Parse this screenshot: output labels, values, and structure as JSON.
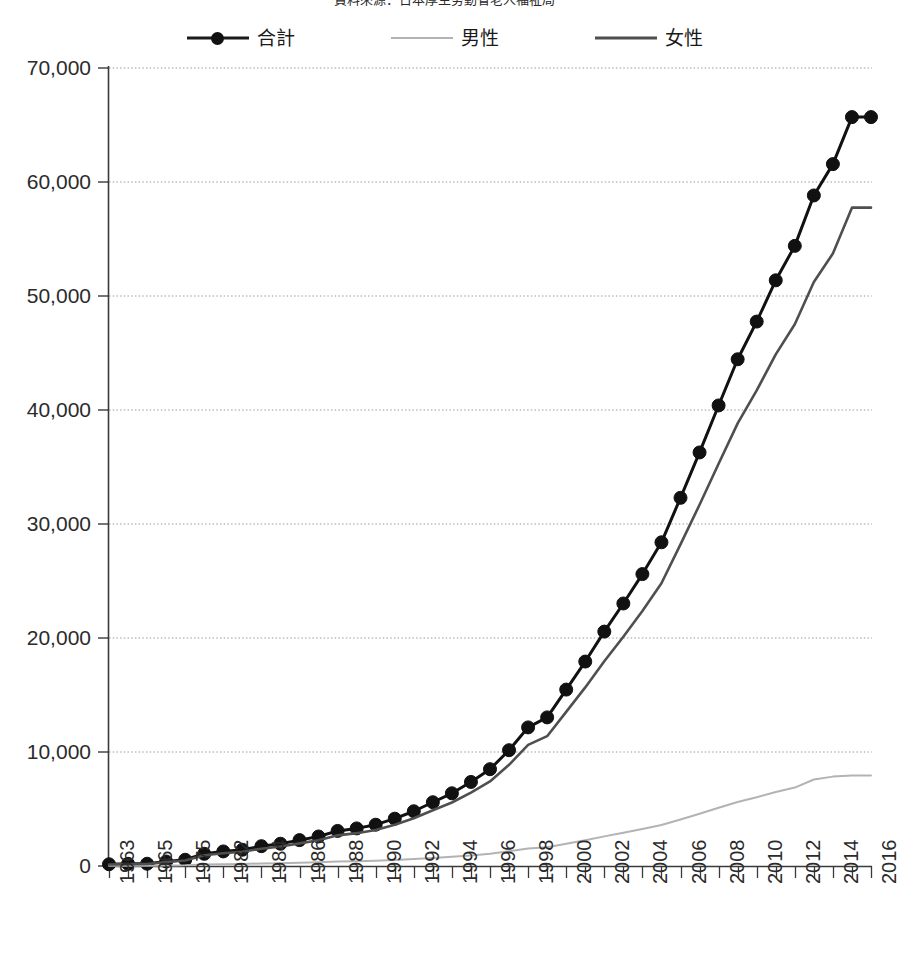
{
  "source_note": "資料來源：日本厚生勞動省老人福祉局",
  "legend": {
    "items": [
      {
        "key": "total",
        "label": "合計",
        "style": "line-with-markers",
        "color": "#111111"
      },
      {
        "key": "male",
        "label": "男性",
        "style": "line",
        "color": "#b3b3b3"
      },
      {
        "key": "female",
        "label": "女性",
        "style": "line",
        "color": "#4f4f4f"
      }
    ]
  },
  "axes": {
    "y_ticks": [
      "0",
      "10,000",
      "20,000",
      "30,000",
      "40,000",
      "50,000",
      "60,000",
      "70,000"
    ],
    "x_tick_labels": [
      "1963",
      "1965",
      "1975",
      "1982",
      "1984",
      "1986",
      "1988",
      "1990",
      "1992",
      "1994",
      "1996",
      "1998",
      "2000",
      "2002",
      "2004",
      "2006",
      "2008",
      "2010",
      "2012",
      "2014",
      "2016"
    ]
  },
  "chart_data": {
    "type": "line",
    "title": "",
    "subtitle": "",
    "xlabel": "",
    "ylabel": "",
    "ylim": [
      0,
      70000
    ],
    "ytick_step": 10000,
    "grid": true,
    "legend_position": "top",
    "annotations": [
      "資料來源：日本厚生勞動省老人福祉局"
    ],
    "categories": [
      "1963",
      "1964",
      "1965",
      "1974",
      "1975",
      "1981",
      "1982",
      "1983",
      "1984",
      "1985",
      "1986",
      "1987",
      "1988",
      "1989",
      "1990",
      "1991",
      "1992",
      "1993",
      "1994",
      "1995",
      "1996",
      "1997",
      "1998",
      "1999",
      "2000",
      "2001",
      "2002",
      "2003",
      "2004",
      "2005",
      "2006",
      "2007",
      "2008",
      "2009",
      "2010",
      "2011",
      "2012",
      "2013",
      "2014",
      "2015",
      "2016"
    ],
    "series": [
      {
        "name": "合計",
        "color": "#111111",
        "marker": "circle",
        "values": [
          153,
          191,
          198,
          396,
          548,
          1072,
          1280,
          1427,
          1740,
          1953,
          2271,
          2589,
          3078,
          3298,
          3624,
          4152,
          4802,
          5593,
          6378,
          7373,
          8491,
          10158,
          12158,
          13036,
          15475,
          17934,
          20561,
          23028,
          25606,
          28395,
          32295,
          36276,
          40399,
          44449,
          47756,
          51376,
          54397,
          58820,
          61568,
          65692,
          65692
        ]
      },
      {
        "name": "男性",
        "color": "#b3b3b3",
        "marker": "none",
        "values": [
          20,
          26,
          29,
          51,
          70,
          136,
          162,
          180,
          220,
          247,
          287,
          327,
          389,
          417,
          458,
          525,
          607,
          707,
          806,
          932,
          1073,
          1284,
          1537,
          1648,
          1956,
          2267,
          2599,
          2912,
          3238,
          3590,
          4083,
          4587,
          5108,
          5620,
          6038,
          6495,
          6878,
          7586,
          7840,
          7940,
          7940
        ]
      },
      {
        "name": "女性",
        "color": "#4f4f4f",
        "marker": "none",
        "values": [
          133,
          165,
          169,
          345,
          478,
          936,
          1118,
          1247,
          1520,
          1706,
          1984,
          2262,
          2689,
          2881,
          3166,
          3627,
          4195,
          4886,
          5572,
          6441,
          7418,
          8874,
          10621,
          11388,
          13519,
          15667,
          17962,
          20116,
          22368,
          24805,
          28212,
          31689,
          35291,
          38829,
          41718,
          44881,
          47519,
          51234,
          53728,
          57752,
          57752
        ]
      }
    ]
  }
}
